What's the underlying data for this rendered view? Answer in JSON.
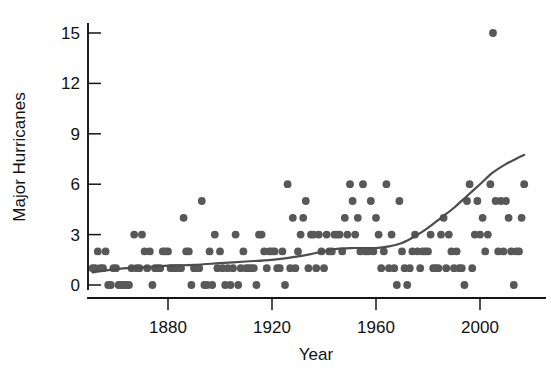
{
  "chart_data": {
    "type": "scatter",
    "title": "",
    "xlabel": "Year",
    "ylabel": "Major Hurricanes",
    "xlim": [
      1848,
      2020
    ],
    "ylim": [
      -0.5,
      16
    ],
    "xticks": [
      1880,
      1920,
      1960,
      2000
    ],
    "yticks": [
      0,
      3,
      6,
      9,
      12,
      15
    ],
    "grid": false,
    "legend": null,
    "marker_color": "#585858",
    "trend_color": "#4d4d4d",
    "axis_color": "#141414",
    "background_color": "#ffffff",
    "series": [
      {
        "name": "Major Hurricanes",
        "marker": "filled-circle",
        "x": [
          1851,
          1852,
          1853,
          1854,
          1855,
          1856,
          1857,
          1858,
          1859,
          1860,
          1861,
          1862,
          1863,
          1864,
          1865,
          1866,
          1867,
          1868,
          1869,
          1870,
          1871,
          1872,
          1873,
          1874,
          1875,
          1876,
          1877,
          1878,
          1879,
          1880,
          1881,
          1882,
          1883,
          1884,
          1885,
          1886,
          1887,
          1888,
          1889,
          1890,
          1891,
          1892,
          1893,
          1894,
          1895,
          1896,
          1897,
          1898,
          1899,
          1900,
          1901,
          1902,
          1903,
          1904,
          1905,
          1906,
          1907,
          1908,
          1909,
          1910,
          1911,
          1912,
          1913,
          1914,
          1915,
          1916,
          1917,
          1918,
          1919,
          1920,
          1921,
          1922,
          1923,
          1924,
          1925,
          1926,
          1927,
          1928,
          1929,
          1930,
          1931,
          1932,
          1933,
          1934,
          1935,
          1936,
          1937,
          1938,
          1939,
          1940,
          1941,
          1942,
          1943,
          1944,
          1945,
          1946,
          1947,
          1948,
          1949,
          1950,
          1951,
          1952,
          1953,
          1954,
          1955,
          1956,
          1957,
          1958,
          1959,
          1960,
          1961,
          1962,
          1963,
          1964,
          1965,
          1966,
          1967,
          1968,
          1969,
          1970,
          1971,
          1972,
          1973,
          1974,
          1975,
          1976,
          1977,
          1978,
          1979,
          1980,
          1981,
          1982,
          1983,
          1984,
          1985,
          1986,
          1987,
          1988,
          1989,
          1990,
          1991,
          1992,
          1993,
          1994,
          1995,
          1996,
          1997,
          1998,
          1999,
          2000,
          2001,
          2002,
          2003,
          2004,
          2005,
          2006,
          2007,
          2008,
          2009,
          2010,
          2011,
          2012,
          2013,
          2014,
          2015,
          2016,
          2017
        ],
        "y": [
          1,
          1,
          2,
          1,
          1,
          2,
          0,
          0,
          1,
          1,
          0,
          0,
          0,
          0,
          0,
          1,
          3,
          1,
          1,
          3,
          2,
          1,
          2,
          0,
          1,
          1,
          1,
          2,
          2,
          2,
          1,
          1,
          1,
          1,
          1,
          4,
          2,
          2,
          0,
          1,
          1,
          1,
          5,
          0,
          0,
          2,
          0,
          3,
          1,
          2,
          1,
          0,
          1,
          0,
          1,
          3,
          0,
          1,
          2,
          1,
          1,
          1,
          1,
          0,
          3,
          3,
          2,
          1,
          2,
          2,
          2,
          1,
          1,
          2,
          0,
          6,
          1,
          4,
          1,
          2,
          3,
          4,
          5,
          1,
          3,
          3,
          1,
          3,
          2,
          1,
          3,
          2,
          2,
          3,
          3,
          3,
          2,
          4,
          3,
          6,
          5,
          3,
          4,
          2,
          6,
          2,
          2,
          5,
          2,
          4,
          3,
          1,
          2,
          6,
          1,
          3,
          1,
          0,
          5,
          2,
          1,
          0,
          1,
          2,
          3,
          2,
          1,
          2,
          2,
          2,
          3,
          1,
          1,
          1,
          3,
          4,
          1,
          3,
          2,
          1,
          2,
          1,
          1,
          0,
          5,
          6,
          1,
          3,
          5,
          3,
          4,
          2,
          3,
          6,
          15,
          5,
          2,
          5,
          2,
          5,
          4,
          2,
          0,
          2,
          2,
          4,
          6
        ]
      }
    ],
    "trend": {
      "name": "LOWESS smoother",
      "x": [
        1851,
        1860,
        1870,
        1880,
        1890,
        1900,
        1910,
        1920,
        1930,
        1940,
        1945,
        1950,
        1955,
        1960,
        1965,
        1970,
        1975,
        1980,
        1985,
        1990,
        1995,
        2000,
        2005,
        2010,
        2015,
        2017
      ],
      "y": [
        0.75,
        0.95,
        1.05,
        1.15,
        1.2,
        1.3,
        1.4,
        1.5,
        1.7,
        2.0,
        2.15,
        2.2,
        2.2,
        2.2,
        2.3,
        2.5,
        2.9,
        3.4,
        4.0,
        4.6,
        5.3,
        6.0,
        6.7,
        7.2,
        7.6,
        7.75
      ]
    }
  },
  "axis": {
    "y_title": "Major Hurricanes",
    "x_title": "Year",
    "y_tick_labels": [
      "0",
      "3",
      "6",
      "9",
      "12",
      "15"
    ],
    "x_tick_labels": [
      "1880",
      "1920",
      "1960",
      "2000"
    ]
  }
}
